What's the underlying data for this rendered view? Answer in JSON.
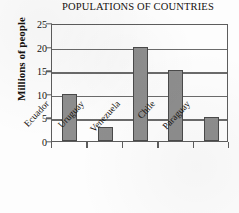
{
  "chart_data": {
    "type": "bar",
    "title": "POPULATIONS OF COUNTRIES",
    "xlabel": "",
    "ylabel": "Millions of people",
    "categories": [
      "Ecuador",
      "Uruguay",
      "Venezuela",
      "Chile",
      "Paraguay"
    ],
    "values": [
      10,
      3,
      20,
      15,
      5
    ],
    "ylim": [
      0,
      25
    ],
    "yticks": [
      0,
      5,
      10,
      15,
      20,
      25
    ],
    "ytick_labels": [
      "0",
      "5",
      "10",
      "15",
      "20",
      "25"
    ],
    "grid": true,
    "legend": false,
    "bar_color": "#8e8e8e",
    "bar_edge_color": "#4a4a4a",
    "axis_color": "#5d5d5d",
    "text_color": "#15120f",
    "background_color": "#fdfdfd"
  }
}
